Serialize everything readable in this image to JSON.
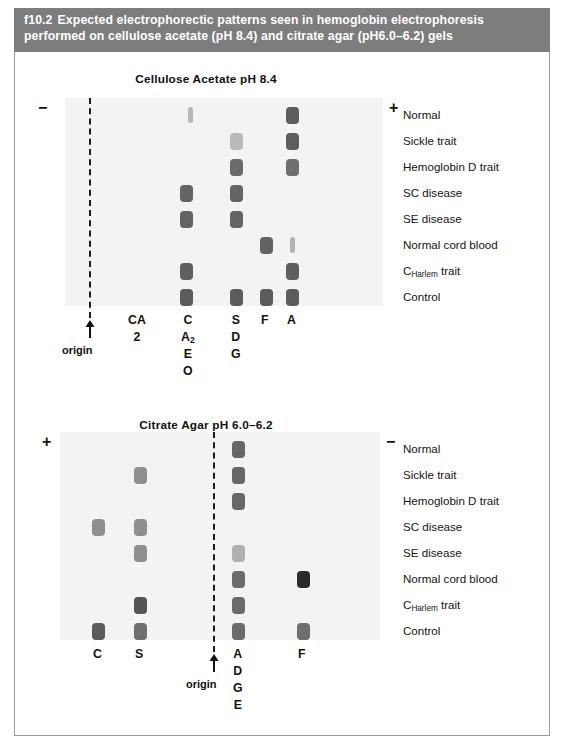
{
  "caption": {
    "id": "f10.2",
    "text": "Expected electrophorectic patterns seen in hemoglobin electrophoresis performed on cellulose acetate (pH 8.4) and citrate agar (pH6.0–6.2) gels",
    "background_color": "#7d7d7d",
    "text_color": "#ffffff"
  },
  "origin_label": "origin",
  "row_labels": [
    "Normal",
    "Sickle trait",
    "Hemoglobin D trait",
    "SC disease",
    "SE disease",
    "Normal cord blood",
    "C Harlem trait",
    "Control"
  ],
  "charlem_prefix": "C",
  "charlem_sub": "Harlem",
  "charlem_suffix": " trait",
  "panels": [
    {
      "key": "cellulose_acetate",
      "title": "Cellulose Acetate pH 8.4",
      "left_polarity": "−",
      "right_polarity": "+",
      "lane_labels": [
        {
          "key": "CA2",
          "lines": [
            "CA",
            "2"
          ],
          "text": "CA2"
        },
        {
          "key": "C",
          "lines": [
            "C",
            "A2",
            "E",
            "O"
          ],
          "text": "C A2 E O"
        },
        {
          "key": "S",
          "lines": [
            "S",
            "D",
            "G"
          ],
          "text": "S D G"
        },
        {
          "key": "F",
          "lines": [
            "F"
          ],
          "text": "F"
        },
        {
          "key": "A",
          "lines": [
            "A"
          ],
          "text": "A"
        }
      ],
      "rows": [
        {
          "sample": "Normal",
          "bands": [
            {
              "lane": "CA2",
              "shade": "#b7b7b7",
              "size": "thin"
            },
            {
              "lane": "A",
              "shade": "#5e5e5e",
              "size": "full"
            }
          ]
        },
        {
          "sample": "Sickle trait",
          "bands": [
            {
              "lane": "S",
              "shade": "#b9b9b9",
              "size": "full"
            },
            {
              "lane": "A",
              "shade": "#5e5e5e",
              "size": "full"
            }
          ]
        },
        {
          "sample": "Hemoglobin D trait",
          "bands": [
            {
              "lane": "S",
              "shade": "#6a6a6a",
              "size": "full"
            },
            {
              "lane": "A",
              "shade": "#6f6f6f",
              "size": "full"
            }
          ]
        },
        {
          "sample": "SC disease",
          "bands": [
            {
              "lane": "C",
              "shade": "#646464",
              "size": "full"
            },
            {
              "lane": "S",
              "shade": "#646464",
              "size": "full"
            }
          ]
        },
        {
          "sample": "SE disease",
          "bands": [
            {
              "lane": "C",
              "shade": "#646464",
              "size": "full"
            },
            {
              "lane": "S",
              "shade": "#646464",
              "size": "full"
            }
          ]
        },
        {
          "sample": "Normal cord blood",
          "bands": [
            {
              "lane": "F",
              "shade": "#636363",
              "size": "full"
            },
            {
              "lane": "A",
              "shade": "#b4b4b4",
              "size": "thin"
            }
          ]
        },
        {
          "sample": "C Harlem trait",
          "bands": [
            {
              "lane": "C",
              "shade": "#5f5f5f",
              "size": "full"
            },
            {
              "lane": "A",
              "shade": "#5f5f5f",
              "size": "full"
            }
          ]
        },
        {
          "sample": "Control",
          "bands": [
            {
              "lane": "C",
              "shade": "#5b5b5b",
              "size": "full"
            },
            {
              "lane": "S",
              "shade": "#5b5b5b",
              "size": "full"
            },
            {
              "lane": "F",
              "shade": "#5b5b5b",
              "size": "full"
            },
            {
              "lane": "A",
              "shade": "#5b5b5b",
              "size": "full"
            }
          ]
        }
      ]
    },
    {
      "key": "citrate_agar",
      "title": "Citrate Agar pH 6.0–6.2",
      "left_polarity": "+",
      "right_polarity": "−",
      "lane_labels": [
        {
          "key": "C",
          "lines": [
            "C"
          ],
          "text": "C"
        },
        {
          "key": "S",
          "lines": [
            "S"
          ],
          "text": "S"
        },
        {
          "key": "A",
          "lines": [
            "A",
            "D",
            "G",
            "E"
          ],
          "text": "A D G E"
        },
        {
          "key": "F",
          "lines": [
            "F"
          ],
          "text": "F"
        }
      ],
      "rows": [
        {
          "sample": "Normal",
          "bands": [
            {
              "lane": "A",
              "shade": "#676767",
              "size": "full"
            }
          ]
        },
        {
          "sample": "Sickle trait",
          "bands": [
            {
              "lane": "S",
              "shade": "#8f8f8f",
              "size": "full"
            },
            {
              "lane": "A",
              "shade": "#676767",
              "size": "full"
            }
          ]
        },
        {
          "sample": "Hemoglobin D trait",
          "bands": [
            {
              "lane": "A",
              "shade": "#676767",
              "size": "full"
            }
          ]
        },
        {
          "sample": "SC disease",
          "bands": [
            {
              "lane": "C",
              "shade": "#8f8f8f",
              "size": "full"
            },
            {
              "lane": "S",
              "shade": "#8f8f8f",
              "size": "full"
            }
          ]
        },
        {
          "sample": "SE disease",
          "bands": [
            {
              "lane": "S",
              "shade": "#8f8f8f",
              "size": "full"
            },
            {
              "lane": "A",
              "shade": "#b0b0b0",
              "size": "full"
            }
          ]
        },
        {
          "sample": "Normal cord blood",
          "bands": [
            {
              "lane": "A",
              "shade": "#6b6b6b",
              "size": "full"
            },
            {
              "lane": "F",
              "shade": "#2b2b2b",
              "size": "full"
            }
          ]
        },
        {
          "sample": "C Harlem trait",
          "bands": [
            {
              "lane": "S",
              "shade": "#545454",
              "size": "full"
            },
            {
              "lane": "A",
              "shade": "#6b6b6b",
              "size": "full"
            }
          ]
        },
        {
          "sample": "Control",
          "bands": [
            {
              "lane": "C",
              "shade": "#5b5b5b",
              "size": "full"
            },
            {
              "lane": "S",
              "shade": "#6f6f6f",
              "size": "full"
            },
            {
              "lane": "A",
              "shade": "#6b6b6b",
              "size": "full"
            },
            {
              "lane": "F",
              "shade": "#6f6f6f",
              "size": "full"
            }
          ]
        }
      ]
    }
  ]
}
